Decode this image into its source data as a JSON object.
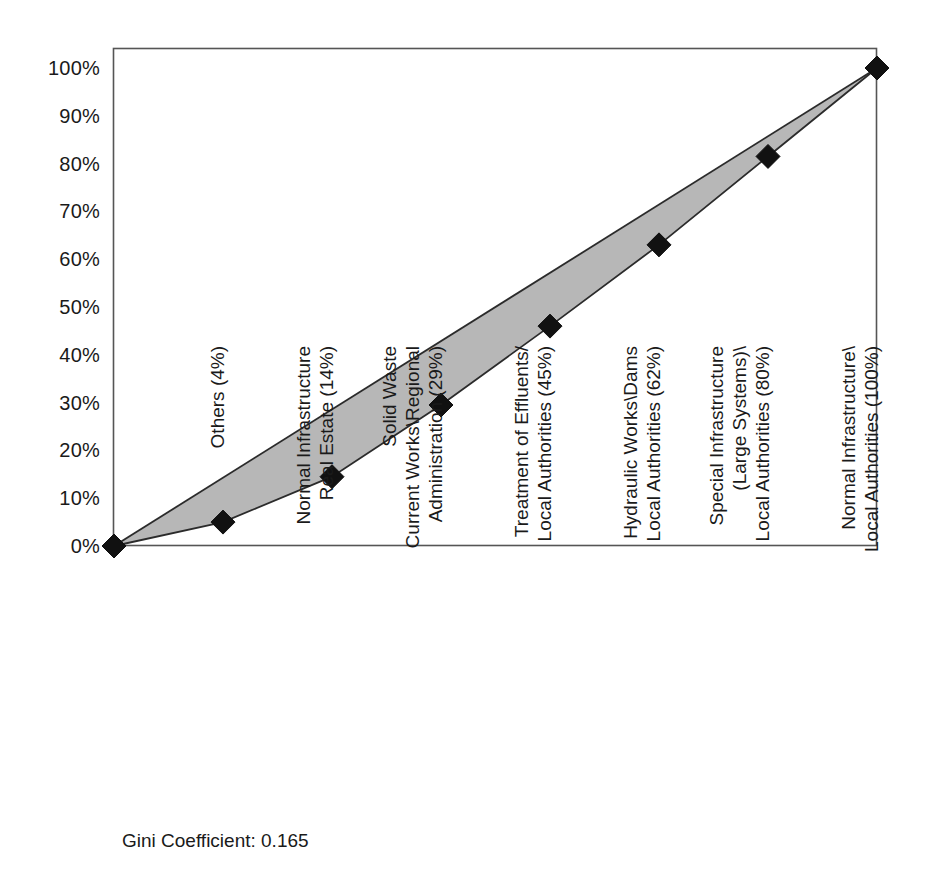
{
  "chart_data": {
    "type": "line",
    "title": "",
    "subtitle": "",
    "xlabel": "",
    "ylabel": "",
    "grid": false,
    "legend": "none",
    "xlim": [
      0,
      7
    ],
    "ylim": [
      0,
      100
    ],
    "y_tick_labels": [
      "100%",
      "90%",
      "80%",
      "70%",
      "60%",
      "50%",
      "40%",
      "30%",
      "20%",
      "10%",
      "0%"
    ],
    "y_tick_values": [
      100,
      90,
      80,
      70,
      60,
      50,
      40,
      30,
      20,
      10,
      0
    ],
    "categories": [
      "Others (4%)",
      "Normal Infrastructure Real Estate (14%)",
      "Solid Waste Current Works\\Regional Administration (29%)",
      "Treatment of Effluents/ Local Authorities (45%)",
      "Hydraulic Works\\Dams Local Authorities (62%)",
      "Special Infrastructure (Large Systems)\\ Local Authorities (80%)",
      "Normal Infrastructure\\ Local Authorities (100%)"
    ],
    "category_label_lines": [
      [
        "Others (4%)"
      ],
      [
        "Normal Infrastructure",
        "Real Estate (14%)"
      ],
      [
        "Solid Waste",
        "Current Works\\Regional",
        "Administration (29%)"
      ],
      [
        "Treatment of Effluents/",
        "Local Authorities (45%)"
      ],
      [
        "Hydraulic Works\\Dams",
        "Local Authorities (62%)"
      ],
      [
        "Special Infrastructure",
        "(Large Systems)\\",
        "Local Authorities (80%)"
      ],
      [
        "Normal Infrastructure\\",
        "Local Authorities (100%)"
      ]
    ],
    "series": [
      {
        "name": "Lorenz curve",
        "marker": "diamond",
        "x": [
          0,
          1,
          2,
          3,
          4,
          5,
          6,
          7
        ],
        "values": [
          0,
          5,
          14.5,
          29.5,
          46,
          63,
          81.5,
          100
        ]
      },
      {
        "name": "Line of equality",
        "marker": "none",
        "x": [
          0,
          7
        ],
        "values": [
          0,
          100
        ]
      }
    ],
    "cumulative_population_pct": [
      0,
      4,
      14,
      29,
      45,
      62,
      80,
      100
    ],
    "annotations": [
      {
        "name": "gini",
        "text": "Gini Coefficient: 0.165"
      }
    ],
    "colors": {
      "fill": "#b3b3b3",
      "line": "#2b2b2b",
      "marker": "#111111",
      "frame": "#555555",
      "text": "#1a1a1a",
      "background": "#ffffff"
    }
  },
  "footnote": {
    "gini_label": "Gini Coefficient: 0.165"
  }
}
